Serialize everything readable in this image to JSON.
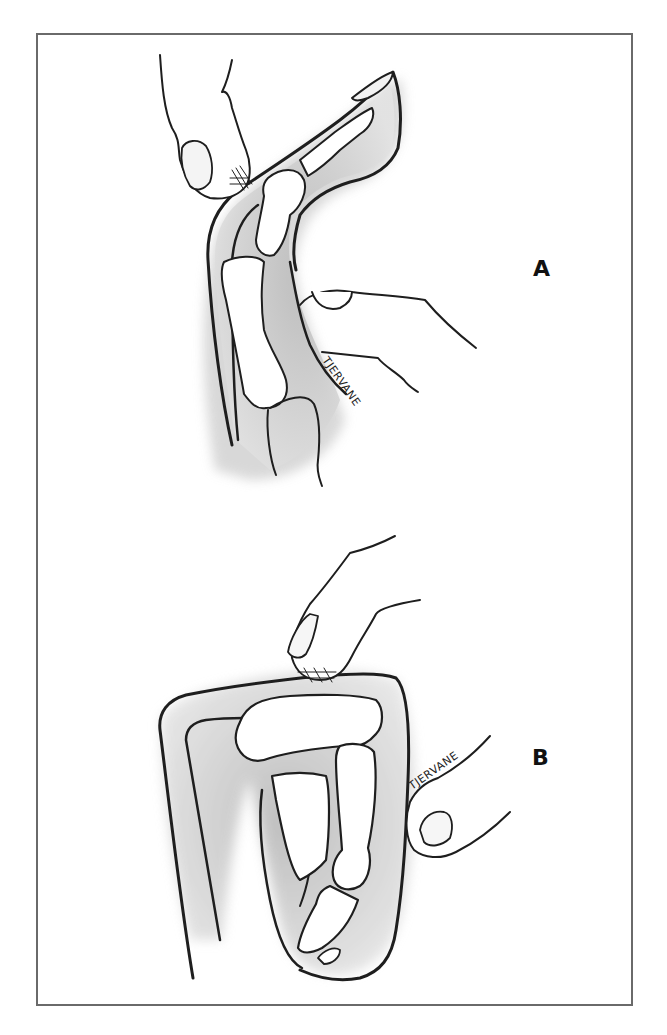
{
  "figure": {
    "panels": [
      {
        "id": "A",
        "label": "A",
        "signature": "TJERVANE",
        "description": "Finger extended: examiner's thumb presses over proximal interphalangeal joint while another finger supports the palmar side"
      },
      {
        "id": "B",
        "label": "B",
        "signature": "TJERVANE",
        "description": "Finger flexed: examiner's fingertip presses on the dorsal surface of the flexed joint while another digit supports from the side"
      }
    ],
    "colors": {
      "border": "#6a6a6a",
      "ink": "#1e1e1e",
      "shading": "#c8c8c8",
      "background": "#ffffff"
    }
  }
}
